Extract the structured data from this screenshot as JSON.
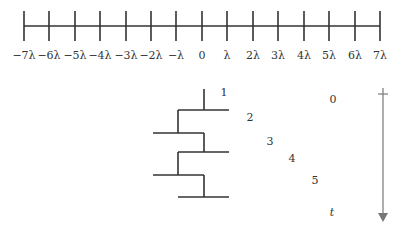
{
  "number_line": {
    "y": 26,
    "x_start": 24,
    "x_end": 380,
    "tick_top": 11,
    "tick_bottom": 41,
    "label_y": 59,
    "ticks": [
      {
        "x": 24,
        "label": "−7λ"
      },
      {
        "x": 49,
        "label": "−6λ"
      },
      {
        "x": 75,
        "label": "−5λ"
      },
      {
        "x": 100,
        "label": "−4λ"
      },
      {
        "x": 126,
        "label": "−3λ"
      },
      {
        "x": 151,
        "label": "−2λ"
      },
      {
        "x": 176,
        "label": "−λ"
      },
      {
        "x": 202,
        "label": "0"
      },
      {
        "x": 227,
        "label": "λ"
      },
      {
        "x": 253,
        "label": "2λ"
      },
      {
        "x": 278,
        "label": "3λ"
      },
      {
        "x": 304,
        "label": "4λ"
      },
      {
        "x": 329,
        "label": "5λ"
      },
      {
        "x": 355,
        "label": "6λ"
      },
      {
        "x": 380,
        "label": "7λ"
      }
    ]
  },
  "ladder": {
    "segments": [
      {
        "x1": 204,
        "y1": 89,
        "x2": 204,
        "y2": 110
      },
      {
        "x1": 178,
        "y1": 110,
        "x2": 229,
        "y2": 110
      },
      {
        "x1": 178,
        "y1": 110,
        "x2": 178,
        "y2": 133
      },
      {
        "x1": 153,
        "y1": 133,
        "x2": 204,
        "y2": 133
      },
      {
        "x1": 204,
        "y1": 133,
        "x2": 204,
        "y2": 152
      },
      {
        "x1": 178,
        "y1": 152,
        "x2": 229,
        "y2": 152
      },
      {
        "x1": 178,
        "y1": 152,
        "x2": 178,
        "y2": 175
      },
      {
        "x1": 153,
        "y1": 175,
        "x2": 204,
        "y2": 175
      },
      {
        "x1": 204,
        "y1": 175,
        "x2": 204,
        "y2": 197
      },
      {
        "x1": 178,
        "y1": 197,
        "x2": 229,
        "y2": 197
      }
    ]
  },
  "step_labels": [
    {
      "text": "1",
      "x": 224,
      "y": 96
    },
    {
      "text": "2",
      "x": 250,
      "y": 121
    },
    {
      "text": "3",
      "x": 270,
      "y": 145
    },
    {
      "text": "4",
      "x": 292,
      "y": 162
    },
    {
      "text": "5",
      "x": 315,
      "y": 184
    }
  ],
  "time_axis": {
    "x": 383,
    "y_top": 94,
    "y_bottom": 222,
    "start_label": "0",
    "start_label_pos": {
      "x": 333,
      "y": 103
    },
    "end_label": "t",
    "end_label_pos": {
      "x": 332,
      "y": 216
    },
    "color": "#777777"
  },
  "colors": {
    "line": "#333333",
    "arrow": "#777777"
  }
}
